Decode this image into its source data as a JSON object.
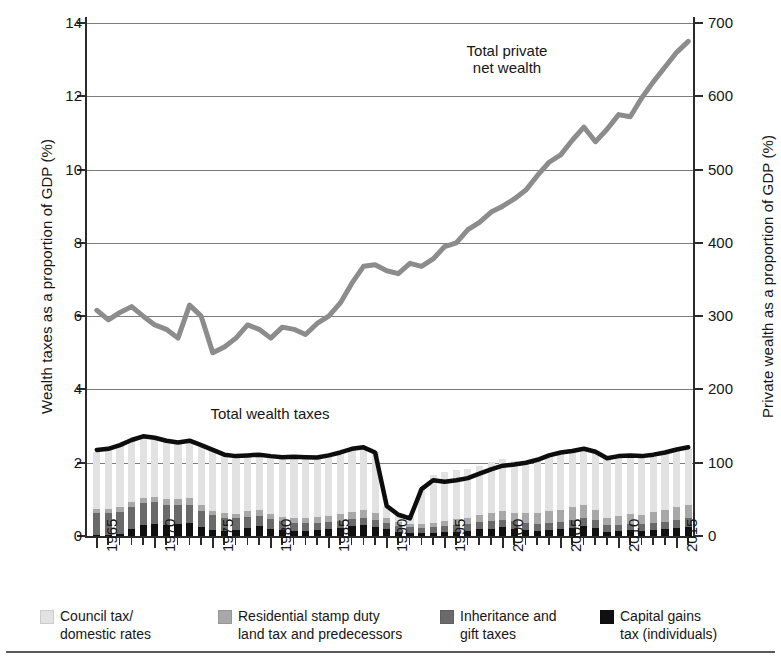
{
  "axes": {
    "y_left_title": "Wealth taxes as a proportion of GDP (%)",
    "y_right_title": "Private wealth as a proportion of GDP (%)",
    "y_left_ticks": [
      "0",
      "2",
      "4",
      "6",
      "8",
      "10",
      "12",
      "14"
    ],
    "y_right_ticks": [
      "0",
      "100",
      "200",
      "300",
      "400",
      "500",
      "600",
      "700"
    ],
    "x_ticks": [
      "1965",
      "1970",
      "1975",
      "1980",
      "1985",
      "1990",
      "1995",
      "2000",
      "2005",
      "2010",
      "2015"
    ]
  },
  "annotations": {
    "private_wealth": "Total private\nnet wealth",
    "wealth_taxes": "Total wealth taxes"
  },
  "legend": {
    "items": [
      {
        "label": "Council tax/\ndomestic rates",
        "color": "#e2e2e2"
      },
      {
        "label": "Residential stamp duty\nland tax and predecessors",
        "color": "#a8a8a8"
      },
      {
        "label": "Inheritance and\ngift taxes",
        "color": "#6a6a6a"
      },
      {
        "label": "Capital gains\ntax (individuals)",
        "color": "#101010"
      }
    ]
  },
  "colors": {
    "council_tax": "#e2e2e2",
    "stamp_duty": "#a8a8a8",
    "inheritance": "#6a6a6a",
    "capital_gains": "#101010",
    "total_taxes_line": "#0d0d0d",
    "private_wealth_line": "#8c8c8c",
    "gridline": "#7d7d7d",
    "axis": "#2b2b2b"
  },
  "chart_data": {
    "type": "bar",
    "title": "",
    "subtitle": "",
    "xlabel": "",
    "ylabel": "Wealth taxes as a proportion of GDP (%)",
    "ylabel_secondary": "Private wealth as a proportion of GDP (%)",
    "ylim": [
      0,
      14
    ],
    "ylim_secondary": [
      0,
      700
    ],
    "xlim": [
      1965,
      2016
    ],
    "grid": true,
    "legend_position": "below",
    "categories": [
      1965,
      1966,
      1967,
      1968,
      1969,
      1970,
      1971,
      1972,
      1973,
      1974,
      1975,
      1976,
      1977,
      1978,
      1979,
      1980,
      1981,
      1982,
      1983,
      1984,
      1985,
      1986,
      1987,
      1988,
      1989,
      1990,
      1991,
      1992,
      1993,
      1994,
      1995,
      1996,
      1997,
      1998,
      1999,
      2000,
      2001,
      2002,
      2003,
      2004,
      2005,
      2006,
      2007,
      2008,
      2009,
      2010,
      2011,
      2012,
      2013,
      2014,
      2015,
      2016
    ],
    "series": [
      {
        "name": "Council tax/domestic rates",
        "type": "bar-stacked",
        "color": "#e2e2e2",
        "values": [
          1.55,
          1.62,
          1.7,
          1.72,
          1.7,
          1.65,
          1.62,
          1.55,
          1.52,
          1.6,
          1.67,
          1.62,
          1.58,
          1.55,
          1.52,
          1.55,
          1.62,
          1.65,
          1.63,
          1.62,
          1.65,
          1.68,
          1.72,
          1.7,
          1.66,
          0.32,
          0.22,
          0.2,
          0.95,
          1.3,
          1.33,
          1.35,
          1.32,
          1.35,
          1.4,
          1.4,
          1.42,
          1.44,
          1.48,
          1.52,
          1.55,
          1.55,
          1.53,
          1.55,
          1.62,
          1.6,
          1.6,
          1.58,
          1.56,
          1.55,
          1.53,
          1.52
        ]
      },
      {
        "name": "Residential stamp duty land tax and predecessors",
        "type": "bar-stacked",
        "color": "#a8a8a8",
        "values": [
          0.12,
          0.12,
          0.13,
          0.14,
          0.15,
          0.14,
          0.15,
          0.18,
          0.2,
          0.15,
          0.13,
          0.12,
          0.13,
          0.15,
          0.16,
          0.14,
          0.13,
          0.13,
          0.14,
          0.15,
          0.16,
          0.18,
          0.2,
          0.22,
          0.18,
          0.12,
          0.1,
          0.09,
          0.1,
          0.12,
          0.14,
          0.16,
          0.18,
          0.2,
          0.22,
          0.25,
          0.24,
          0.26,
          0.28,
          0.32,
          0.34,
          0.36,
          0.38,
          0.28,
          0.18,
          0.24,
          0.26,
          0.26,
          0.3,
          0.34,
          0.36,
          0.38
        ]
      },
      {
        "name": "Inheritance and gift taxes",
        "type": "bar-stacked",
        "color": "#6a6a6a",
        "values": [
          0.6,
          0.58,
          0.6,
          0.62,
          0.6,
          0.58,
          0.56,
          0.52,
          0.48,
          0.45,
          0.4,
          0.36,
          0.32,
          0.3,
          0.28,
          0.26,
          0.24,
          0.22,
          0.22,
          0.2,
          0.2,
          0.2,
          0.2,
          0.2,
          0.2,
          0.18,
          0.16,
          0.16,
          0.16,
          0.16,
          0.17,
          0.18,
          0.18,
          0.19,
          0.2,
          0.2,
          0.2,
          0.2,
          0.2,
          0.2,
          0.2,
          0.21,
          0.22,
          0.22,
          0.18,
          0.17,
          0.17,
          0.18,
          0.19,
          0.2,
          0.22,
          0.24
        ]
      },
      {
        "name": "Capital gains tax (individuals)",
        "type": "bar-stacked",
        "color": "#101010",
        "values": [
          0.02,
          0.04,
          0.06,
          0.18,
          0.3,
          0.34,
          0.3,
          0.32,
          0.36,
          0.24,
          0.16,
          0.14,
          0.16,
          0.22,
          0.26,
          0.2,
          0.16,
          0.14,
          0.14,
          0.16,
          0.18,
          0.22,
          0.26,
          0.3,
          0.24,
          0.18,
          0.12,
          0.08,
          0.07,
          0.08,
          0.1,
          0.12,
          0.14,
          0.18,
          0.2,
          0.24,
          0.2,
          0.16,
          0.14,
          0.16,
          0.18,
          0.22,
          0.26,
          0.22,
          0.12,
          0.14,
          0.16,
          0.14,
          0.16,
          0.18,
          0.22,
          0.24
        ]
      },
      {
        "name": "Total wealth taxes",
        "type": "line",
        "axis": "left",
        "color": "#0d0d0d",
        "values": [
          2.35,
          2.38,
          2.48,
          2.62,
          2.72,
          2.68,
          2.6,
          2.55,
          2.6,
          2.48,
          2.35,
          2.22,
          2.18,
          2.2,
          2.22,
          2.18,
          2.15,
          2.16,
          2.15,
          2.14,
          2.2,
          2.28,
          2.38,
          2.42,
          2.28,
          0.82,
          0.58,
          0.48,
          1.28,
          1.52,
          1.48,
          1.52,
          1.58,
          1.7,
          1.82,
          1.92,
          1.95,
          2.0,
          2.08,
          2.2,
          2.28,
          2.32,
          2.38,
          2.3,
          2.12,
          2.18,
          2.2,
          2.18,
          2.22,
          2.28,
          2.36,
          2.42
        ]
      },
      {
        "name": "Total private net wealth",
        "type": "line",
        "axis": "right",
        "color": "#8c8c8c",
        "values": [
          308,
          295,
          305,
          313,
          300,
          288,
          282,
          270,
          315,
          300,
          250,
          258,
          270,
          288,
          282,
          270,
          285,
          282,
          275,
          290,
          300,
          318,
          345,
          368,
          370,
          362,
          358,
          372,
          368,
          378,
          395,
          400,
          418,
          428,
          442,
          450,
          460,
          472,
          492,
          510,
          520,
          540,
          558,
          538,
          555,
          575,
          572,
          598,
          620,
          640,
          660,
          675
        ]
      }
    ]
  }
}
